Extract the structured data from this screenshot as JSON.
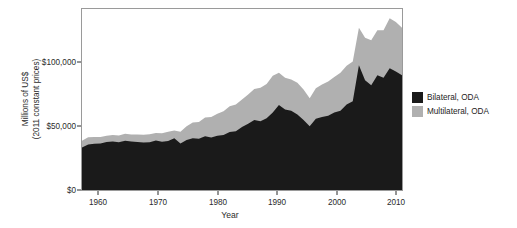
{
  "chart_data": {
    "type": "area",
    "stacked": true,
    "title": "",
    "xlabel": "Year",
    "ylabel": "Millions of US$ (2011 constant prices)",
    "ylabel_line1": "Millions of US$",
    "ylabel_line2": "(2011 constant prices)",
    "xlim": [
      1960,
      2012
    ],
    "ylim": [
      0,
      145000
    ],
    "grid": false,
    "legend_position": "right",
    "xticks": [
      1960,
      1970,
      1980,
      1990,
      2000,
      2010
    ],
    "xtick_labels": [
      "1960",
      "1970",
      "1980",
      "1990",
      "2000",
      "2010"
    ],
    "yticks": [
      0,
      50000,
      100000
    ],
    "ytick_labels": [
      "$0",
      "$50,000",
      "$100,000"
    ],
    "colors": {
      "bilateral": "#1a1a1a",
      "multilateral": "#b0b0b0",
      "panel_border": "#9a9a9a",
      "text": "#2b2b2b"
    },
    "x": [
      1960,
      1961,
      1962,
      1963,
      1964,
      1965,
      1966,
      1967,
      1968,
      1969,
      1970,
      1971,
      1972,
      1973,
      1974,
      1975,
      1976,
      1977,
      1978,
      1979,
      1980,
      1981,
      1982,
      1983,
      1984,
      1985,
      1986,
      1987,
      1988,
      1989,
      1990,
      1991,
      1992,
      1993,
      1994,
      1995,
      1996,
      1997,
      1998,
      1999,
      2000,
      2001,
      2002,
      2003,
      2004,
      2005,
      2006,
      2007,
      2008,
      2009,
      2010,
      2011,
      2012
    ],
    "series": [
      {
        "name": "Bilateral, ODA",
        "color": "#1a1a1a",
        "values": [
          34000,
          36500,
          37000,
          37200,
          38500,
          38800,
          38200,
          39500,
          38800,
          38500,
          38000,
          38200,
          39600,
          38600,
          39200,
          41500,
          37200,
          40000,
          41500,
          41000,
          43000,
          42000,
          43500,
          44000,
          46500,
          47000,
          50500,
          53000,
          56000,
          55000,
          57500,
          62000,
          68000,
          64500,
          63500,
          60500,
          56000,
          51000,
          57000,
          58500,
          59500,
          62000,
          63500,
          68500,
          71000,
          100000,
          88000,
          84000,
          92000,
          90000,
          97500,
          95000,
          92000
        ]
      },
      {
        "name": "Multilateral, ODA",
        "color": "#b0b0b0",
        "values": [
          5500,
          5800,
          5400,
          5200,
          5000,
          5200,
          5400,
          5500,
          5600,
          6000,
          6200,
          6400,
          6000,
          6800,
          7500,
          6200,
          9500,
          11000,
          12500,
          13500,
          15000,
          16500,
          17500,
          19000,
          20500,
          21500,
          22000,
          23500,
          25000,
          27000,
          27500,
          29500,
          26000,
          25500,
          25000,
          25500,
          24500,
          22500,
          24500,
          26000,
          27500,
          28500,
          30500,
          31000,
          32000,
          30000,
          34000,
          36000,
          36000,
          38000,
          40000,
          39500,
          38000
        ]
      }
    ]
  },
  "legend": {
    "items": [
      {
        "label": "Bilateral, ODA",
        "color": "#1a1a1a"
      },
      {
        "label": "Multilateral, ODA",
        "color": "#b0b0b0"
      }
    ]
  }
}
